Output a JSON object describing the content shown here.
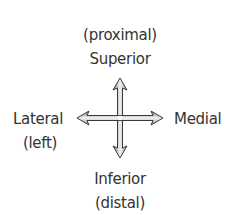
{
  "diagram": {
    "labels": {
      "top_qualifier": "(proximal)",
      "top": "Superior",
      "left": "Lateral",
      "left_qualifier": "(left)",
      "right": "Medial",
      "bottom": "Inferior",
      "bottom_qualifier": "(distal)"
    },
    "arrows": [
      {
        "direction": "up",
        "points_to": "Superior"
      },
      {
        "direction": "down",
        "points_to": "Inferior"
      },
      {
        "direction": "left",
        "points_to": "Lateral"
      },
      {
        "direction": "right",
        "points_to": "Medial"
      }
    ],
    "colors": {
      "text": "#333333",
      "arrow_outline": "#3a3a3a",
      "arrow_fill_dark": "#8a8a8a",
      "arrow_fill_light": "#f2f2f2"
    }
  }
}
